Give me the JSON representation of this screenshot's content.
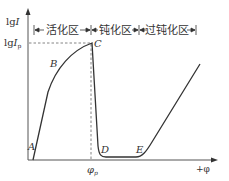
{
  "diagram": {
    "title": "",
    "type": "anodic polarization curve",
    "colors": {
      "line": "#333333",
      "axis": "#555555",
      "dash": "#666666",
      "background": "#ffffff"
    },
    "axes": {
      "y_label_main": "lg",
      "y_label_italic": "I",
      "y_tick_main": "lg",
      "y_tick_italic": "I",
      "y_tick_sub": "p",
      "x_label": "+φ",
      "x_tick_main": "φ",
      "x_tick_sub": "p"
    },
    "regions": [
      {
        "label": "活化区"
      },
      {
        "label": "钝化区"
      },
      {
        "label": "过钝化区"
      }
    ],
    "points": [
      {
        "label": "A"
      },
      {
        "label": "B"
      },
      {
        "label": "C"
      },
      {
        "label": "D"
      },
      {
        "label": "E"
      }
    ]
  }
}
